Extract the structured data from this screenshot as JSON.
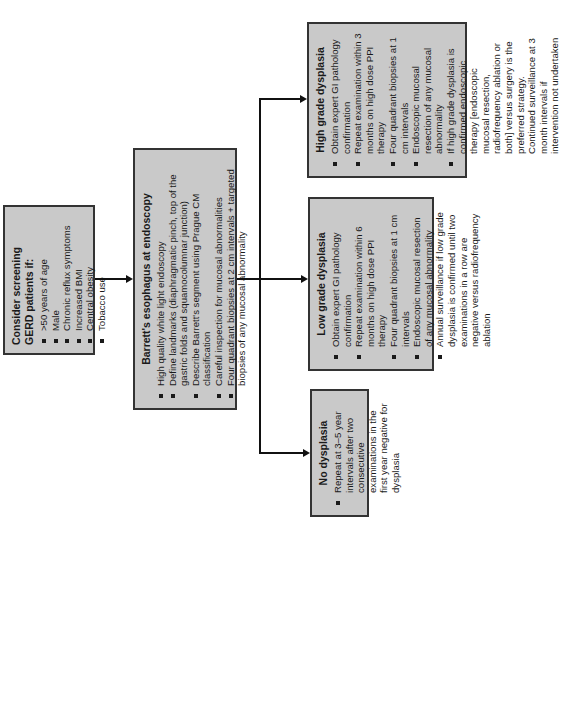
{
  "screening": {
    "title": "Consider screening GERD patients if:",
    "items": [
      ">50 years of age",
      "Male",
      "Chronic reflux symptoms",
      "Increased BMI",
      "Central obesity",
      "Tobacco use"
    ]
  },
  "barretts": {
    "title": "Barrett's esophagus at endoscopy",
    "items": [
      "High quality white light endoscopy",
      "Define landmarks (diaphragmatic pinch, top of the gastric folds and squamocolumnar junction)",
      "Describe Barrett's segment using Prague CM classification",
      "Careful inspection for mucosal abnormalities",
      "Four quadrant biopsies at 2 cm intervals + targeted biopsies of any mucosal abnormality"
    ]
  },
  "high_grade": {
    "title": "High grade dysplasia",
    "items": [
      "Obtain expert GI pathology confirmation",
      "Repeat examination within 3 months on high dose PPI therapy",
      "Four quadrant biopsies at 1 cm intervals",
      "Endoscopic mucosal resection of any mucosal abnormality",
      "If high grade dysplasia is confirmed endoscopic therapy [endoscopic mucosal resection, radiofrequency ablation or both] versus surgery is the preferred strategy. Continued surveillance at 3 month intervals if intervention not undertaken"
    ]
  },
  "low_grade": {
    "title": "Low grade dysplasia",
    "items": [
      "Obtain expert GI pathology confirmation",
      "Repeat examination within 6 months on high dose PPI therapy",
      "Four quadrant biopsies at 1 cm intervals",
      "Endoscopic mucosal resection of any mucosal abnormality",
      "Annual surveillance if low grade dysplasia is confirmed until two examinations in a row are negative versus radiofrequency ablation"
    ]
  },
  "no_dysplasia": {
    "title": "No dysplasia",
    "items": [
      "Repeat at 3–5 year intervals after two consecutive examinations in the first year negative for dysplasia"
    ]
  },
  "colors": {
    "box_fill": "#c9c9c9",
    "box_border": "#333333",
    "line": "#111111"
  }
}
